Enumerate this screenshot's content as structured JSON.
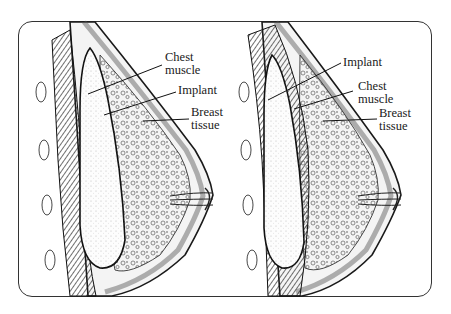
{
  "diagram": {
    "type": "anatomical illustration",
    "panels": [
      {
        "id": "left",
        "description": "Implant placed under breast tissue, over chest muscle (subglandular)",
        "labels": {
          "chest_muscle_line1": "Chest",
          "chest_muscle_line2": "muscle",
          "implant": "Implant",
          "breast_tissue_line1": "Breast",
          "breast_tissue_line2": "tissue"
        }
      },
      {
        "id": "right",
        "description": "Implant placed under chest muscle (submuscular)",
        "labels": {
          "implant": "Implant",
          "chest_muscle_line1": "Chest",
          "chest_muscle_line2": "muscle",
          "breast_tissue_line1": "Breast",
          "breast_tissue_line2": "tissue"
        }
      }
    ],
    "colors": {
      "ink": "#1a1a1a",
      "background": "#ffffff",
      "frame": "#333333",
      "shading": "#888888"
    }
  }
}
